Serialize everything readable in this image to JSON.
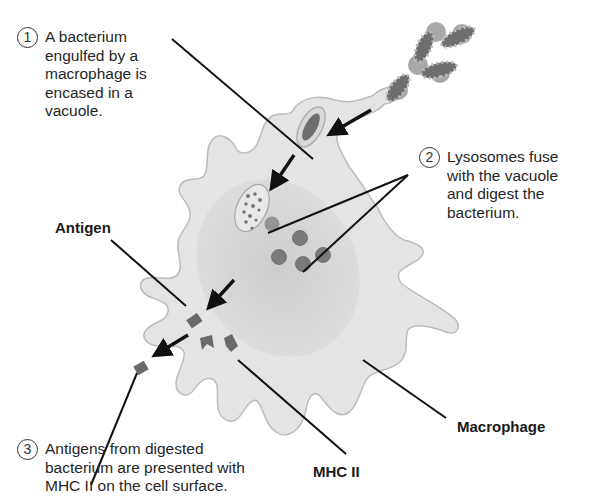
{
  "diagram": {
    "steps": [
      {
        "number": "1",
        "text": "A bacterium\nengulfed by a\nmacrophage is\nencased in a\nvacuole."
      },
      {
        "number": "2",
        "text": "Lysosomes fuse\nwith the vacuole\nand digest the\nbacterium."
      },
      {
        "number": "3",
        "text": "Antigens from digested\nbacterium are presented with\nMHC II on the cell surface."
      }
    ],
    "labels": {
      "antigen": "Antigen",
      "mhc": "MHC II",
      "macrophage": "Macrophage"
    },
    "colors": {
      "cell_fill": "#e6e6e6",
      "cell_outline": "#bdbdbd",
      "cell_inner": "#d2d2d2",
      "bacterium": "#6e6e6e",
      "lysosome": "#7a7a7a",
      "line": "#111111"
    }
  }
}
